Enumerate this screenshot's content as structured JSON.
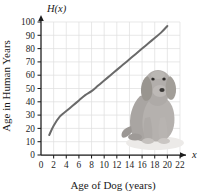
{
  "chart_data": {
    "type": "line",
    "title": "",
    "function_label": "H(x)",
    "xlabel": "Age of Dog (years)",
    "ylabel": "Age in Human Years",
    "x_axis_symbol": "x",
    "xlim": [
      0,
      22
    ],
    "ylim": [
      0,
      100
    ],
    "xticks": [
      0,
      2,
      4,
      6,
      8,
      10,
      12,
      14,
      16,
      18,
      20,
      22
    ],
    "yticks": [
      0,
      10,
      20,
      30,
      40,
      50,
      60,
      70,
      80,
      90,
      100
    ],
    "xtick_labels": [
      "0",
      "2",
      "4",
      "6",
      "8",
      "10",
      "12",
      "14",
      "16",
      "18",
      "20",
      "22"
    ],
    "ytick_labels": [
      "0",
      "10",
      "20",
      "30",
      "40",
      "50",
      "60",
      "70",
      "80",
      "90",
      "100"
    ],
    "grid": true,
    "legend": "none",
    "series": [
      {
        "name": "H(x)",
        "color": "#6a6a6a",
        "x": [
          1.3,
          2,
          3,
          4,
          5,
          6,
          7,
          8,
          9,
          10,
          11,
          12,
          13,
          14,
          15,
          16,
          17,
          18,
          19,
          20
        ],
        "y": [
          15,
          22,
          29,
          33,
          37,
          41,
          45,
          48,
          52,
          56,
          60,
          64,
          68,
          72,
          76,
          80,
          84,
          88,
          92,
          97
        ]
      }
    ],
    "annotations": [
      {
        "name": "dog-photograph",
        "description": "grayscale photo of a sitting dog",
        "x_range": [
          13.3,
          19.6
        ],
        "y_range": [
          6,
          62
        ]
      }
    ]
  },
  "colors": {
    "curve": "#6a6a6a",
    "axis": "#1d1d1d",
    "grid": "#dedede",
    "background": "#ffffff",
    "dog_light": "#d8d4d0",
    "dog_mid": "#a9a5a2",
    "dog_dark": "#7c7876"
  }
}
